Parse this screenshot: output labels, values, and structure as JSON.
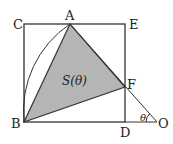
{
  "diagram": {
    "points": {
      "A": {
        "label": "A",
        "x": 70,
        "y": 24
      },
      "B": {
        "label": "B",
        "x": 24,
        "y": 122
      },
      "C": {
        "label": "C",
        "x": 24,
        "y": 24
      },
      "D": {
        "label": "D",
        "x": 125,
        "y": 122
      },
      "E": {
        "label": "E",
        "x": 125,
        "y": 24
      },
      "F": {
        "label": "F",
        "x": 125,
        "y": 87
      },
      "O": {
        "label": "O",
        "x": 157,
        "y": 122
      }
    },
    "area_label": "S(θ)",
    "angle_label": "θ",
    "colors": {
      "stroke": "#333333",
      "fill": "#b5b5b5"
    }
  }
}
